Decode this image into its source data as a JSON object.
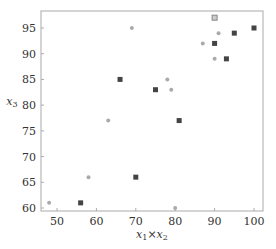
{
  "chart_data": {
    "type": "scatter",
    "title": "",
    "xlabel": "x1×x2",
    "ylabel": "x3",
    "xlim": [
      46,
      102
    ],
    "ylim": [
      59.4,
      98.3
    ],
    "xticks": [
      50,
      60,
      70,
      80,
      90,
      100
    ],
    "yticks": [
      60,
      65,
      70,
      75,
      80,
      85,
      90,
      95
    ],
    "grid": false,
    "legend": null,
    "series": [
      {
        "name": "light-circles",
        "marker": "circle",
        "color": "#aaaaaa",
        "points": [
          [
            48,
            61
          ],
          [
            58,
            66
          ],
          [
            63,
            77
          ],
          [
            69,
            95
          ],
          [
            78,
            85
          ],
          [
            79,
            83
          ],
          [
            87,
            92
          ],
          [
            90,
            89
          ],
          [
            91,
            94
          ],
          [
            80,
            60
          ]
        ]
      },
      {
        "name": "dark-squares",
        "marker": "square",
        "color": "#444444",
        "points": [
          [
            56,
            61
          ],
          [
            66,
            85
          ],
          [
            70,
            66
          ],
          [
            75,
            83
          ],
          [
            81,
            77
          ],
          [
            90,
            92
          ],
          [
            93,
            89
          ],
          [
            95,
            94
          ],
          [
            100,
            95
          ]
        ]
      },
      {
        "name": "hatched-square",
        "marker": "square-hatched",
        "color": "#888888",
        "points": [
          [
            90,
            97
          ]
        ]
      }
    ]
  },
  "colors": {
    "frame": "#999999",
    "text": "#333333"
  }
}
